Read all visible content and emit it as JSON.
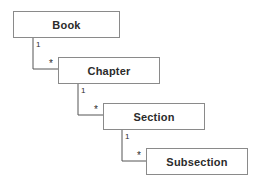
{
  "diagram": {
    "type": "uml-composition-hierarchy",
    "background_color": "#ffffff",
    "box_border_color": "#8a8a8a",
    "box_fill_color": "#ffffff",
    "line_color": "#555555",
    "text_color": "#2b2b2b",
    "nodes": [
      {
        "id": "book",
        "label": "Book",
        "x": 13,
        "y": 11,
        "width": 107,
        "height": 27
      },
      {
        "id": "chapter",
        "label": "Chapter",
        "x": 58,
        "y": 57,
        "width": 102,
        "height": 27
      },
      {
        "id": "section",
        "label": "Section",
        "x": 103,
        "y": 103,
        "width": 102,
        "height": 27
      },
      {
        "id": "subsection",
        "label": "Subsection",
        "x": 146,
        "y": 148,
        "width": 102,
        "height": 27
      }
    ],
    "edges": [
      {
        "id": "book-chapter",
        "from": "book",
        "to": "chapter",
        "parent_multiplicity": "1",
        "child_multiplicity": "*",
        "path": "M33,38 L33,69 L58,69",
        "parent_label_x": 36,
        "parent_label_y": 41,
        "child_label_x": 49,
        "child_label_y": 59
      },
      {
        "id": "chapter-section",
        "from": "chapter",
        "to": "section",
        "parent_multiplicity": "1",
        "child_multiplicity": "*",
        "path": "M78,84 L78,115 L103,115",
        "parent_label_x": 81,
        "parent_label_y": 87,
        "child_label_x": 94,
        "child_label_y": 105
      },
      {
        "id": "section-subsection",
        "from": "section",
        "to": "subsection",
        "parent_multiplicity": "1",
        "child_multiplicity": "*",
        "path": "M122,130 L122,161 L146,161",
        "parent_label_x": 125,
        "parent_label_y": 133,
        "child_label_x": 137,
        "child_label_y": 151
      }
    ]
  }
}
